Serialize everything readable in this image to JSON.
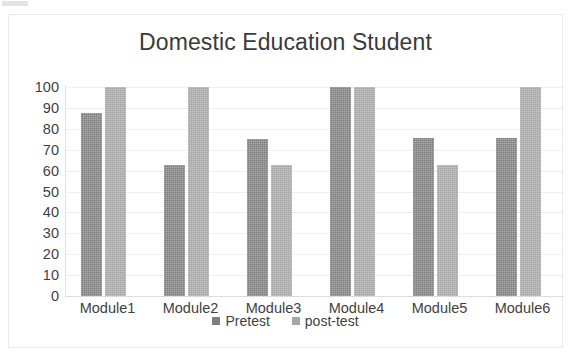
{
  "chart_data": {
    "type": "bar",
    "title": "Domestic Education Student",
    "xlabel": "",
    "ylabel": "",
    "ylim": [
      0,
      100
    ],
    "yticks": [
      0,
      10,
      20,
      30,
      40,
      50,
      60,
      70,
      80,
      90,
      100
    ],
    "ytick_labels": [
      "0",
      "10",
      "20",
      "30",
      "40",
      "50",
      "60",
      "70",
      "80",
      "90",
      "100"
    ],
    "grid": true,
    "legend_position": "bottom",
    "categories": [
      "Module1",
      "Module2",
      "Module3",
      "Module4",
      "Module5",
      "Module6"
    ],
    "series": [
      {
        "name": "Pretest",
        "color": "#7f7f7f",
        "values": [
          87.5,
          62.5,
          75,
          100,
          75.5,
          75.5
        ]
      },
      {
        "name": "post-test",
        "color": "#a6a6a6",
        "values": [
          100,
          100,
          62.5,
          100,
          62.5,
          100
        ]
      }
    ]
  }
}
